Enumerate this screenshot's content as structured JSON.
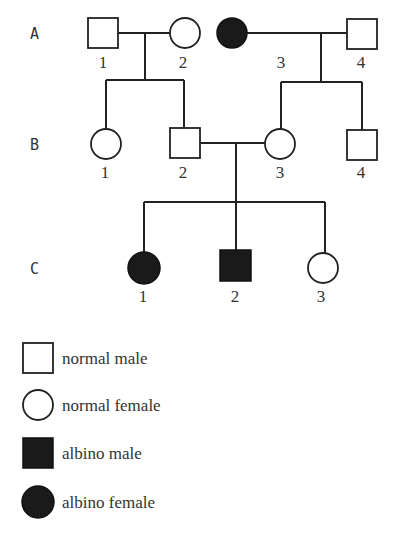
{
  "pedigree": {
    "generations": [
      {
        "label": "A",
        "individuals": [
          {
            "num": "1",
            "sex": "male",
            "status": "normal"
          },
          {
            "num": "2",
            "sex": "female",
            "status": "normal"
          },
          {
            "num": "3",
            "sex": "female",
            "status": "albino"
          },
          {
            "num": "4",
            "sex": "male",
            "status": "normal"
          }
        ]
      },
      {
        "label": "B",
        "individuals": [
          {
            "num": "1",
            "sex": "female",
            "status": "normal",
            "parents": "A1 x A2"
          },
          {
            "num": "2",
            "sex": "male",
            "status": "normal",
            "parents": "A1 x A2"
          },
          {
            "num": "3",
            "sex": "female",
            "status": "normal",
            "parents": "A3 x A4"
          },
          {
            "num": "4",
            "sex": "male",
            "status": "normal",
            "parents": "A3 x A4"
          }
        ]
      },
      {
        "label": "C",
        "individuals": [
          {
            "num": "1",
            "sex": "female",
            "status": "albino",
            "parents": "B2 x B3"
          },
          {
            "num": "2",
            "sex": "male",
            "status": "albino",
            "parents": "B2 x B3"
          },
          {
            "num": "3",
            "sex": "female",
            "status": "normal",
            "parents": "B2 x B3"
          }
        ]
      }
    ],
    "matings": [
      "A1 x A2",
      "A3 x A4",
      "B2 x B3"
    ]
  },
  "legend": [
    {
      "symbol": "open-square",
      "label": "normal male"
    },
    {
      "symbol": "open-circle",
      "label": "normal female"
    },
    {
      "symbol": "filled-square",
      "label": "albino male"
    },
    {
      "symbol": "filled-circle",
      "label": "albino female"
    }
  ]
}
